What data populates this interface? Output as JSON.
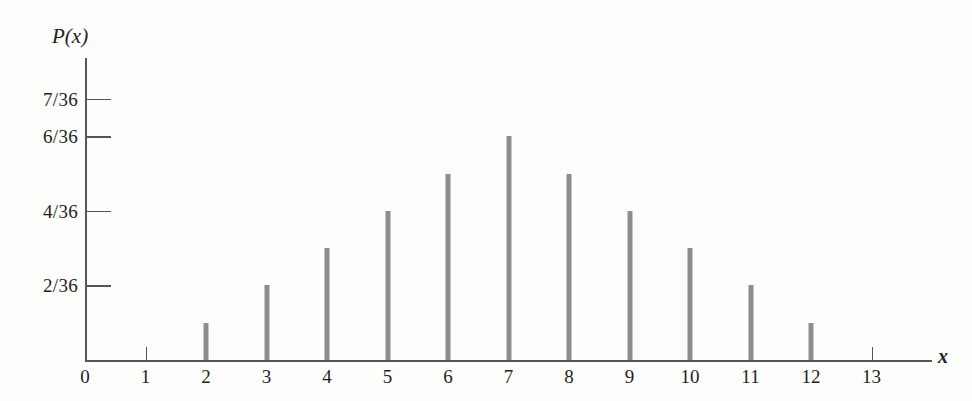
{
  "chart_data": {
    "type": "bar",
    "title": "",
    "subtitle": "",
    "xlabel": "x",
    "ylabel": "P(x)",
    "grid": false,
    "legend": null,
    "legend_position": "none",
    "categories": [
      2,
      3,
      4,
      5,
      6,
      7,
      8,
      9,
      10,
      11,
      12
    ],
    "values": [
      1,
      2,
      3,
      4,
      5,
      6,
      5,
      4,
      3,
      2,
      1
    ],
    "value_labels": [
      "1/36",
      "2/36",
      "3/36",
      "4/36",
      "5/36",
      "6/36",
      "5/36",
      "4/36",
      "3/36",
      "2/36",
      "1/36"
    ],
    "value_denominator": 36,
    "xlim": [
      0,
      13
    ],
    "ylim": [
      0,
      7
    ],
    "x_ticks": [
      {
        "value": 0,
        "label": "0"
      },
      {
        "value": 1,
        "label": "1"
      },
      {
        "value": 2,
        "label": "2"
      },
      {
        "value": 3,
        "label": "3"
      },
      {
        "value": 4,
        "label": "4"
      },
      {
        "value": 5,
        "label": "5"
      },
      {
        "value": 6,
        "label": "6"
      },
      {
        "value": 7,
        "label": "7"
      },
      {
        "value": 8,
        "label": "8"
      },
      {
        "value": 9,
        "label": "9"
      },
      {
        "value": 10,
        "label": "10"
      },
      {
        "value": 11,
        "label": "11"
      },
      {
        "value": 12,
        "label": "12"
      },
      {
        "value": 13,
        "label": "13"
      }
    ],
    "y_ticks": [
      {
        "value": 7,
        "label": "7/36"
      },
      {
        "value": 6,
        "label": "6/36"
      },
      {
        "value": 4,
        "label": "4/36"
      },
      {
        "value": 2,
        "label": "2/36"
      }
    ]
  },
  "colors": {
    "bar": "#8d8d90",
    "axis": "#56565a",
    "text": "#1f1f22",
    "background": "#fdfdfc"
  }
}
